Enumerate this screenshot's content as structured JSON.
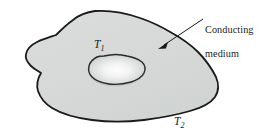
{
  "figure": {
    "background_color": "#ffffff",
    "width": 268,
    "height": 135,
    "outline_color": "#1a1a1a",
    "medium_fill_color": "#d7dad8",
    "cavity_center_color": "#fdfdfd",
    "cavity_edge_color": "#c4c8c6",
    "leader_line_color": "#1a1a1a"
  },
  "labels": {
    "callout": "Conducting\nmedium",
    "callout_line1": "Conducting",
    "callout_line2": "medium",
    "inner_temperature": "T",
    "inner_temperature_subscript": "1",
    "outer_temperature": "T",
    "outer_temperature_subscript": "2"
  },
  "shapes": {
    "outer_body": {
      "name": "conducting-medium-outline",
      "path": "M 95,11 C 112,10 126,13 140,18 C 152,22 162,27 172,33 C 181,38 190,44 198,52 C 206,60 212,69 216,77 C 219,84 219,91 215,97 C 210,104 201,108 190,111 C 176,115 160,118 144,120 C 126,122 108,122 92,120 C 76,118 62,114 52,108 C 44,103 40,97 38,91 C 36,84 38,78 41,73 C 38,71 34,69 31,66 C 27,62 25,58 26,54 C 27,49 31,45 37,42 C 43,39 50,37 56,35 C 61,30 66,25 73,20 C 79,15 87,12 95,11 Z"
    },
    "cavity": {
      "name": "cavity-outline",
      "path": "M 104,57 C 112,55 120,55 127,57 C 133,58 138,60 142,63 C 145,66 146,70 144,74 C 142,78 137,81 131,83 C 124,85 116,86 109,85 C 102,84 96,82 92,78 C 89,75 88,71 89,67 C 90,63 93,60 97,58 C 99,57 101,57 104,57 Z"
    },
    "leader_arrow": {
      "name": "callout-leader-arrow",
      "from": [
        204,
        19
      ],
      "to": [
        160,
        48
      ]
    }
  }
}
